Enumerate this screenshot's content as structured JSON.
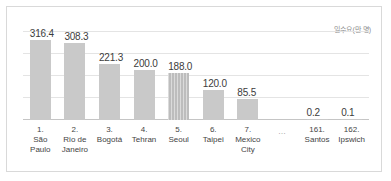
{
  "chart_data": {
    "type": "bar",
    "title": "",
    "subtitle": "",
    "xlabel": "",
    "ylabel": "일수요(만 명)",
    "axis_caption": "일수요(만 명)",
    "grid": true,
    "legend": false,
    "ylim": [
      0,
      350
    ],
    "gridlines": [
      70,
      140,
      210,
      280
    ],
    "categories": [
      "São Paulo",
      "Rio de Janeiro",
      "Bogotá",
      "Tehran",
      "Seoul",
      "Taipei",
      "Mexico City",
      "…",
      "Santos",
      "Ipswich"
    ],
    "ranks": [
      "1.",
      "2.",
      "3.",
      "4.",
      "5.",
      "6.",
      "7.",
      "",
      "161.",
      "162."
    ],
    "values": [
      316.4,
      308.3,
      221.3,
      200.0,
      188.0,
      120.0,
      85.5,
      null,
      0.2,
      0.1
    ],
    "value_labels": [
      "316.4",
      "308.3",
      "221.3",
      "200.0",
      "188.0",
      "120.0",
      "85.5",
      "",
      "0.2",
      "0.1"
    ],
    "highlight_index": 4,
    "colors": {
      "bar": "#c9c9c9",
      "bar_highlight": "#bdbdbd",
      "gridline": "#e4e4e4",
      "axis": "#c5c5c5",
      "border": "#d9d9d9",
      "label_text": "#3c3c3c",
      "caption_text": "#8d8d8d",
      "background": "#ffffff"
    }
  },
  "bars": [
    {
      "rank": "1.",
      "name_line1": "São",
      "name_line2": "Paulo",
      "value": "316.4"
    },
    {
      "rank": "2.",
      "name_line1": "Rio de",
      "name_line2": "Janeiro",
      "value": "308.3"
    },
    {
      "rank": "3.",
      "name_line1": "Bogotá",
      "name_line2": "",
      "value": "221.3"
    },
    {
      "rank": "4.",
      "name_line1": "Tehran",
      "name_line2": "",
      "value": "200.0"
    },
    {
      "rank": "5.",
      "name_line1": "Seoul",
      "name_line2": "",
      "value": "188.0"
    },
    {
      "rank": "6.",
      "name_line1": "Taipei",
      "name_line2": "",
      "value": "120.0"
    },
    {
      "rank": "7.",
      "name_line1": "Mexico",
      "name_line2": "City",
      "value": "85.5"
    },
    {
      "rank": "",
      "name_line1": "…",
      "name_line2": "",
      "value": ""
    },
    {
      "rank": "161.",
      "name_line1": "Santos",
      "name_line2": "",
      "value": "0.2"
    },
    {
      "rank": "162.",
      "name_line1": "Ipswich",
      "name_line2": "",
      "value": "0.1"
    }
  ]
}
